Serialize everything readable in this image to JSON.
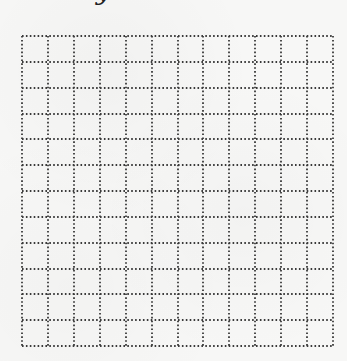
{
  "title_fragment": "y",
  "grid": {
    "rows": 12,
    "columns": 12,
    "cell_size_px": 26,
    "line_style": "dotted",
    "line_color": "#3a3a3a",
    "background_color": "#f7f7f6"
  }
}
